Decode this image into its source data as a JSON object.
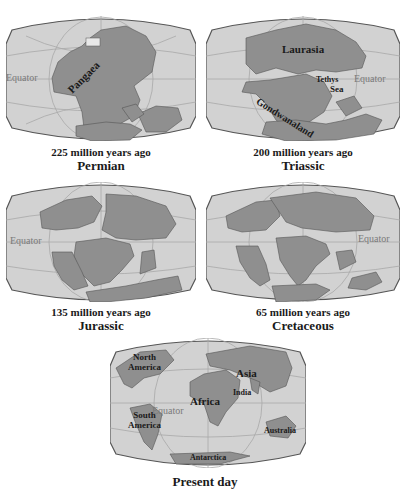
{
  "figure": {
    "colors": {
      "ocean": "#d2d2d2",
      "land": "#8f8f8f",
      "grid": "#a8a8a8",
      "border": "#555555",
      "equator_label": "#7a7a7a"
    }
  },
  "panels": [
    {
      "id": "permian",
      "age": "225 million years ago",
      "period": "Permian",
      "labels": {
        "equator": "Equator",
        "continent": "Pangaea"
      }
    },
    {
      "id": "triassic",
      "age": "200 million years ago",
      "period": "Triassic",
      "labels": {
        "equator": "Equator",
        "north": "Laurasia",
        "sea_1": "Tethys",
        "sea_2": "Sea",
        "south": "Gondwanaland"
      }
    },
    {
      "id": "jurassic",
      "age": "135 million years ago",
      "period": "Jurassic",
      "labels": {
        "equator": "Equator"
      }
    },
    {
      "id": "cretaceous",
      "age": "65 million years ago",
      "period": "Cretaceous",
      "labels": {
        "equator": "Equator"
      }
    },
    {
      "id": "present",
      "age": "",
      "period": "Present day",
      "labels": {
        "equator": "Equator",
        "north_america_1": "North",
        "north_america_2": "America",
        "south_america_1": "South",
        "south_america_2": "America",
        "africa": "Africa",
        "asia": "Asia",
        "india": "India",
        "australia": "Australia",
        "antarctica": "Antarctica"
      }
    }
  ]
}
